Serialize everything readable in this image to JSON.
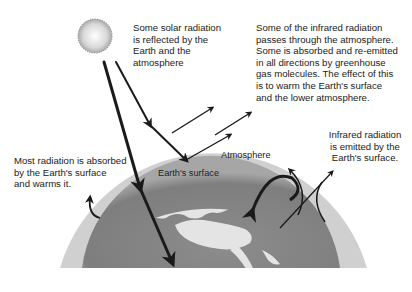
{
  "diagram": {
    "labels": {
      "reflected": "Some solar radiation\nis reflected by the\nEarth and the\natmosphere",
      "infrared_pass": "Some of the infrared radiation\npasses through the atmosphere.\nSome is absorbed and re-emitted\nin all directions by greenhouse\ngas molecules. The effect of this\nis to warm the Earth's surface\nand the lower atmosphere.",
      "infrared_emitted": "Infrared radiation\nis emitted by the\nEarth's surface.",
      "absorbed": "Most radiation is absorbed\nby the Earth's surface\nand warms it.",
      "atmosphere": "Atmosphere",
      "earth_surface": "Earth's surface"
    },
    "colors": {
      "background": "#ffffff",
      "atmosphere": "#cfcfcf",
      "earth_ocean": "#8a8a8a",
      "earth_land": "#e6e6e6",
      "sun": "#d9d9d9",
      "arrows": "#1a1a1a",
      "text": "#222222"
    }
  }
}
